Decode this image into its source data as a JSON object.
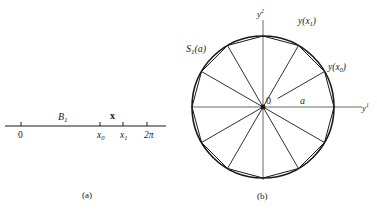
{
  "colors": {
    "ink": "#1a1a1a",
    "axis": "#444444",
    "background": "#ffffff"
  },
  "panel_a": {
    "caption": "(a)",
    "line": {
      "x1": 5,
      "x2": 166,
      "y": 126
    },
    "ticks": [
      {
        "x": 21,
        "label": "0",
        "sub": ""
      },
      {
        "x": 100,
        "label": "x",
        "sub": "0"
      },
      {
        "x": 123,
        "label": "x",
        "sub": "1"
      },
      {
        "x": 147,
        "label": "2π",
        "sub": ""
      }
    ],
    "interval_labels": [
      {
        "name": "B",
        "sub": "1",
        "x": 58,
        "y": 120,
        "style": "italic"
      },
      {
        "name": "x",
        "sub": "",
        "x": 110,
        "y": 119,
        "style": "bold"
      }
    ]
  },
  "panel_b": {
    "caption": "(b)",
    "center": {
      "x": 263,
      "y": 107
    },
    "radius": 71,
    "polygon_sides": 12,
    "axis_labels": {
      "horizontal": "y",
      "horizontal_sup": "1",
      "vertical": "y",
      "vertical_sup": "2"
    },
    "origin_label": "0",
    "radius_label": "a",
    "circle_label": {
      "text": "S",
      "sub": "1",
      "arg": "(a)"
    },
    "point_labels": [
      {
        "text": "y(x",
        "sub": "1",
        "close": ")",
        "x": 298,
        "y": 24
      },
      {
        "text": "y(x",
        "sub": "0",
        "close": ")",
        "x": 328,
        "y": 70
      }
    ]
  }
}
